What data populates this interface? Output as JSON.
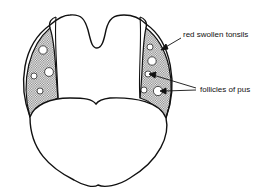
{
  "diagram": {
    "labels": {
      "tonsils": "red swollen tonsils",
      "follicles": "follicles of pus"
    },
    "colors": {
      "stroke": "#111111",
      "stipple": "#8a8a8a",
      "background": "#ffffff"
    }
  }
}
